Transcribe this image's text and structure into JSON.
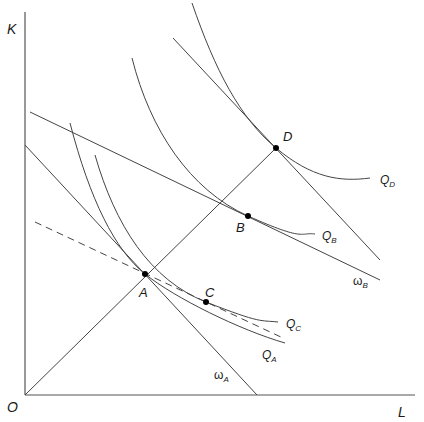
{
  "axes": {
    "y_label": "K",
    "x_label": "L",
    "origin_label": "O"
  },
  "points": {
    "A": "A",
    "B": "B",
    "C": "C",
    "D": "D"
  },
  "isoquants": {
    "QA": {
      "main": "Q",
      "sub": "A"
    },
    "QB": {
      "main": "Q",
      "sub": "B"
    },
    "QC": {
      "main": "Q",
      "sub": "C"
    },
    "QD": {
      "main": "Q",
      "sub": "D"
    }
  },
  "isocosts": {
    "wA": {
      "main": "ω",
      "sub": "A"
    },
    "wB": {
      "main": "ω",
      "sub": "B"
    }
  },
  "colors": {
    "line": "#444444",
    "axis": "#555555",
    "point": "#000000",
    "background": "#ffffff"
  }
}
